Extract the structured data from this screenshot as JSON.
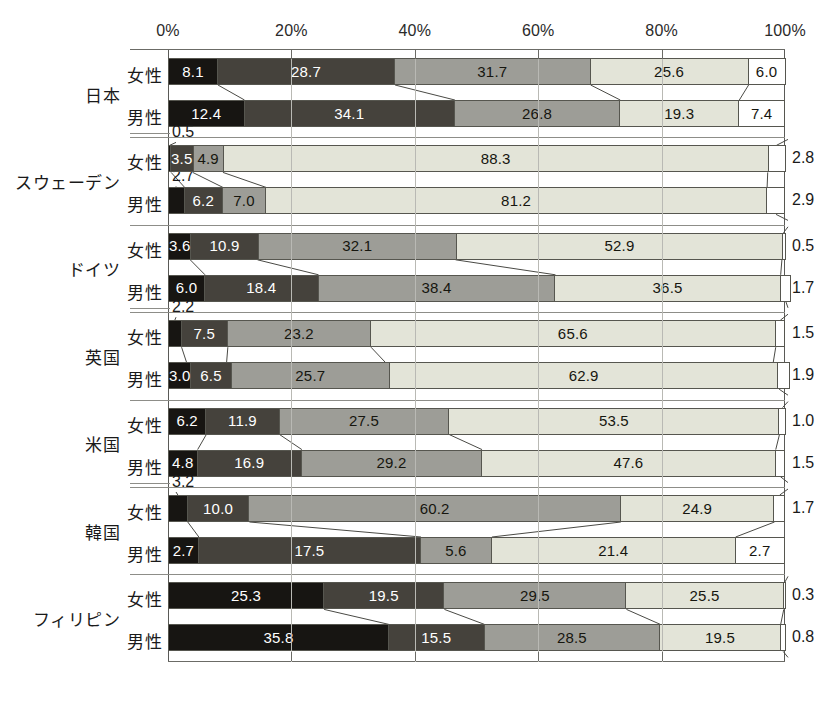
{
  "chart_data": {
    "type": "bar",
    "orientation": "horizontal",
    "stacked": "100%",
    "title": "",
    "xlabel": "",
    "ylabel": "",
    "xlim": [
      0,
      100
    ],
    "grid": true,
    "legend_position": "none",
    "x_tick_labels": [
      "0%",
      "20%",
      "40%",
      "60%",
      "80%",
      "100%"
    ],
    "x_ticks": [
      0,
      20,
      40,
      60,
      80,
      100
    ],
    "series_count": 5,
    "series_colors": [
      "#171512",
      "#45423c",
      "#9d9d97",
      "#e3e4d8",
      "#ffffff"
    ],
    "categories": [
      "日本 女性",
      "日本 男性",
      "スウェーデン 女性",
      "スウェーデン 男性",
      "ドイツ 女性",
      "ドイツ 男性",
      "英国 女性",
      "英国 男性",
      "米国 女性",
      "米国 男性",
      "韓国 女性",
      "韓国 男性",
      "フィリピン 女性",
      "フィリピン 男性"
    ],
    "rows": [
      {
        "country": "日本",
        "sex": "女性",
        "values": [
          8.1,
          28.7,
          31.7,
          25.6,
          6.0
        ]
      },
      {
        "country": "日本",
        "sex": "男性",
        "values": [
          12.4,
          34.1,
          26.8,
          19.3,
          7.4
        ]
      },
      {
        "country": "スウェーデン",
        "sex": "女性",
        "values": [
          0.5,
          3.5,
          4.9,
          88.3,
          2.8
        ]
      },
      {
        "country": "スウェーデン",
        "sex": "男性",
        "values": [
          2.7,
          6.2,
          7.0,
          81.2,
          2.9
        ]
      },
      {
        "country": "ドイツ",
        "sex": "女性",
        "values": [
          3.6,
          10.9,
          32.1,
          52.9,
          0.5
        ]
      },
      {
        "country": "ドイツ",
        "sex": "男性",
        "values": [
          6.0,
          18.4,
          38.4,
          36.5,
          1.7
        ]
      },
      {
        "country": "英国",
        "sex": "女性",
        "values": [
          2.2,
          7.5,
          23.2,
          65.6,
          1.5
        ]
      },
      {
        "country": "英国",
        "sex": "男性",
        "values": [
          3.0,
          6.5,
          25.7,
          62.9,
          1.9
        ]
      },
      {
        "country": "米国",
        "sex": "女性",
        "values": [
          6.2,
          11.9,
          27.5,
          53.5,
          1.0
        ]
      },
      {
        "country": "米国",
        "sex": "男性",
        "values": [
          4.8,
          16.9,
          29.2,
          47.6,
          1.5
        ]
      },
      {
        "country": "韓国",
        "sex": "女性",
        "values": [
          3.2,
          10.0,
          60.2,
          24.9,
          1.7
        ]
      },
      {
        "country": "韓国",
        "sex": "男性",
        "values": [
          2.7,
          17.5,
          5.6,
          21.4,
          2.7
        ]
      },
      {
        "country": "フィリピン",
        "sex": "女性",
        "values": [
          25.3,
          19.5,
          29.5,
          25.5,
          0.3
        ]
      },
      {
        "country": "フィリピン",
        "sex": "男性",
        "values": [
          35.8,
          15.5,
          28.5,
          19.5,
          0.8
        ]
      }
    ]
  },
  "axis": {
    "ticks": [
      {
        "label": "0%",
        "pos": 0
      },
      {
        "label": "20%",
        "pos": 20
      },
      {
        "label": "40%",
        "pos": 40
      },
      {
        "label": "60%",
        "pos": 60
      },
      {
        "label": "80%",
        "pos": 80
      },
      {
        "label": "100%",
        "pos": 100
      }
    ]
  },
  "groups": [
    {
      "country": "日本",
      "rows": [
        {
          "sex": "女性",
          "segments": [
            {
              "value": "8.1",
              "pct": 8.1,
              "shade": 0,
              "label_mode": "inside"
            },
            {
              "value": "28.7",
              "pct": 28.7,
              "shade": 1,
              "label_mode": "inside"
            },
            {
              "value": "31.7",
              "pct": 31.7,
              "shade": 2,
              "label_mode": "inside"
            },
            {
              "value": "25.6",
              "pct": 25.6,
              "shade": 3,
              "label_mode": "inside"
            },
            {
              "value": "6.0",
              "pct": 6.0,
              "shade": 4,
              "label_mode": "inside"
            }
          ]
        },
        {
          "sex": "男性",
          "segments": [
            {
              "value": "12.4",
              "pct": 12.4,
              "shade": 0,
              "label_mode": "inside"
            },
            {
              "value": "34.1",
              "pct": 34.1,
              "shade": 1,
              "label_mode": "inside"
            },
            {
              "value": "26.8",
              "pct": 26.8,
              "shade": 2,
              "label_mode": "inside"
            },
            {
              "value": "19.3",
              "pct": 19.3,
              "shade": 3,
              "label_mode": "inside"
            },
            {
              "value": "7.4",
              "pct": 7.4,
              "shade": 4,
              "label_mode": "inside"
            }
          ]
        }
      ]
    },
    {
      "country": "スウェーデン",
      "rows": [
        {
          "sex": "女性",
          "leader": "0.5",
          "segments": [
            {
              "value": "0.5",
              "pct": 0.5,
              "shade": 0,
              "label_mode": "leader"
            },
            {
              "value": "3.5",
              "pct": 3.5,
              "shade": 1,
              "label_mode": "inside"
            },
            {
              "value": "4.9",
              "pct": 4.9,
              "shade": 2,
              "label_mode": "inside"
            },
            {
              "value": "88.3",
              "pct": 88.3,
              "shade": 3,
              "label_mode": "inside"
            },
            {
              "value": "2.8",
              "pct": 2.8,
              "shade": 4,
              "label_mode": "outside"
            }
          ]
        },
        {
          "sex": "男性",
          "leader": "2.7",
          "segments": [
            {
              "value": "2.7",
              "pct": 2.7,
              "shade": 0,
              "label_mode": "leader"
            },
            {
              "value": "6.2",
              "pct": 6.2,
              "shade": 1,
              "label_mode": "inside"
            },
            {
              "value": "7.0",
              "pct": 7.0,
              "shade": 2,
              "label_mode": "inside"
            },
            {
              "value": "81.2",
              "pct": 81.2,
              "shade": 3,
              "label_mode": "inside"
            },
            {
              "value": "2.9",
              "pct": 2.9,
              "shade": 4,
              "label_mode": "outside"
            }
          ]
        }
      ]
    },
    {
      "country": "ドイツ",
      "rows": [
        {
          "sex": "女性",
          "segments": [
            {
              "value": "3.6",
              "pct": 3.6,
              "shade": 0,
              "label_mode": "inside"
            },
            {
              "value": "10.9",
              "pct": 10.9,
              "shade": 1,
              "label_mode": "inside"
            },
            {
              "value": "32.1",
              "pct": 32.1,
              "shade": 2,
              "label_mode": "inside"
            },
            {
              "value": "52.9",
              "pct": 52.9,
              "shade": 3,
              "label_mode": "inside"
            },
            {
              "value": "0.5",
              "pct": 0.5,
              "shade": 4,
              "label_mode": "outside"
            }
          ]
        },
        {
          "sex": "男性",
          "segments": [
            {
              "value": "6.0",
              "pct": 6.0,
              "shade": 0,
              "label_mode": "inside"
            },
            {
              "value": "18.4",
              "pct": 18.4,
              "shade": 1,
              "label_mode": "inside"
            },
            {
              "value": "38.4",
              "pct": 38.4,
              "shade": 2,
              "label_mode": "inside"
            },
            {
              "value": "36.5",
              "pct": 36.5,
              "shade": 3,
              "label_mode": "inside"
            },
            {
              "value": "1.7",
              "pct": 1.7,
              "shade": 4,
              "label_mode": "outside"
            }
          ]
        }
      ]
    },
    {
      "country": "英国",
      "rows": [
        {
          "sex": "女性",
          "leader": "2.2",
          "segments": [
            {
              "value": "2.2",
              "pct": 2.2,
              "shade": 0,
              "label_mode": "leader"
            },
            {
              "value": "7.5",
              "pct": 7.5,
              "shade": 1,
              "label_mode": "inside"
            },
            {
              "value": "23.2",
              "pct": 23.2,
              "shade": 2,
              "label_mode": "inside"
            },
            {
              "value": "65.6",
              "pct": 65.6,
              "shade": 3,
              "label_mode": "inside"
            },
            {
              "value": "1.5",
              "pct": 1.5,
              "shade": 4,
              "label_mode": "outside"
            }
          ]
        },
        {
          "sex": "男性",
          "segments": [
            {
              "value": "3.0",
              "pct": 3.0,
              "shade": 0,
              "label_mode": "inside"
            },
            {
              "value": "6.5",
              "pct": 6.5,
              "shade": 1,
              "label_mode": "inside"
            },
            {
              "value": "25.7",
              "pct": 25.7,
              "shade": 2,
              "label_mode": "inside"
            },
            {
              "value": "62.9",
              "pct": 62.9,
              "shade": 3,
              "label_mode": "inside"
            },
            {
              "value": "1.9",
              "pct": 1.9,
              "shade": 4,
              "label_mode": "outside"
            }
          ]
        }
      ]
    },
    {
      "country": "米国",
      "rows": [
        {
          "sex": "女性",
          "segments": [
            {
              "value": "6.2",
              "pct": 6.2,
              "shade": 0,
              "label_mode": "inside"
            },
            {
              "value": "11.9",
              "pct": 11.9,
              "shade": 1,
              "label_mode": "inside"
            },
            {
              "value": "27.5",
              "pct": 27.5,
              "shade": 2,
              "label_mode": "inside"
            },
            {
              "value": "53.5",
              "pct": 53.5,
              "shade": 3,
              "label_mode": "inside"
            },
            {
              "value": "1.0",
              "pct": 1.0,
              "shade": 4,
              "label_mode": "outside"
            }
          ]
        },
        {
          "sex": "男性",
          "segments": [
            {
              "value": "4.8",
              "pct": 4.8,
              "shade": 0,
              "label_mode": "inside"
            },
            {
              "value": "16.9",
              "pct": 16.9,
              "shade": 1,
              "label_mode": "inside"
            },
            {
              "value": "29.2",
              "pct": 29.2,
              "shade": 2,
              "label_mode": "inside"
            },
            {
              "value": "47.6",
              "pct": 47.6,
              "shade": 3,
              "label_mode": "inside"
            },
            {
              "value": "1.5",
              "pct": 1.5,
              "shade": 4,
              "label_mode": "outside"
            }
          ]
        }
      ]
    },
    {
      "country": "韓国",
      "rows": [
        {
          "sex": "女性",
          "leader": "3.2",
          "segments": [
            {
              "value": "3.2",
              "pct": 3.2,
              "shade": 0,
              "label_mode": "leader"
            },
            {
              "value": "10.0",
              "pct": 10.0,
              "shade": 1,
              "label_mode": "inside"
            },
            {
              "value": "60.2",
              "pct": 60.2,
              "shade": 2,
              "label_mode": "inside"
            },
            {
              "value": "24.9",
              "pct": 24.9,
              "shade": 3,
              "label_mode": "inside"
            },
            {
              "value": "1.7",
              "pct": 1.7,
              "shade": 4,
              "label_mode": "outside"
            }
          ]
        },
        {
          "sex": "男性",
          "segments": [
            {
              "value": "2.7",
              "pct": 5.0,
              "shade": 0,
              "label_mode": "inside"
            },
            {
              "value": "17.5",
              "pct": 36.0,
              "shade": 1,
              "label_mode": "inside"
            },
            {
              "value": "5.6",
              "pct": 11.5,
              "shade": 2,
              "label_mode": "inside"
            },
            {
              "value": "21.4",
              "pct": 39.5,
              "shade": 3,
              "label_mode": "inside"
            },
            {
              "value": "2.7",
              "pct": 8.0,
              "shade": 4,
              "label_mode": "inside"
            }
          ]
        }
      ]
    },
    {
      "country": "フィリピン",
      "rows": [
        {
          "sex": "女性",
          "segments": [
            {
              "value": "25.3",
              "pct": 25.3,
              "shade": 0,
              "label_mode": "inside"
            },
            {
              "value": "19.5",
              "pct": 19.5,
              "shade": 1,
              "label_mode": "inside"
            },
            {
              "value": "29.5",
              "pct": 29.5,
              "shade": 2,
              "label_mode": "inside"
            },
            {
              "value": "25.5",
              "pct": 25.5,
              "shade": 3,
              "label_mode": "inside"
            },
            {
              "value": "0.3",
              "pct": 0.3,
              "shade": 4,
              "label_mode": "outside"
            }
          ]
        },
        {
          "sex": "男性",
          "segments": [
            {
              "value": "35.8",
              "pct": 35.8,
              "shade": 0,
              "label_mode": "inside"
            },
            {
              "value": "15.5",
              "pct": 15.5,
              "shade": 1,
              "label_mode": "inside"
            },
            {
              "value": "28.5",
              "pct": 28.5,
              "shade": 2,
              "label_mode": "inside"
            },
            {
              "value": "19.5",
              "pct": 19.5,
              "shade": 3,
              "label_mode": "inside"
            },
            {
              "value": "0.8",
              "pct": 0.8,
              "shade": 4,
              "label_mode": "outside"
            }
          ]
        }
      ]
    }
  ]
}
